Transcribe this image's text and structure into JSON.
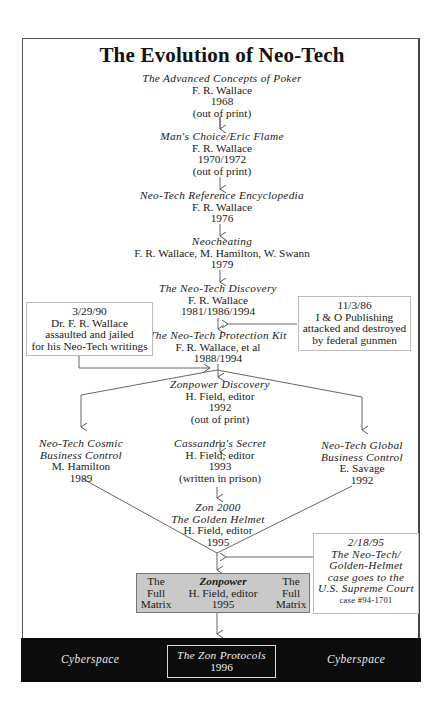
{
  "title": "The Evolution of Neo-Tech",
  "nodes": [
    {
      "title": "The Advanced Concepts of Poker",
      "author": "F. R. Wallace",
      "year": "1968",
      "note": "(out of print)"
    },
    {
      "title": "Man's Choice/Eric Flame",
      "author": "F. R. Wallace",
      "year": "1970/1972",
      "note": "(out of print)"
    },
    {
      "title": "Neo-Tech Reference Encyclopedia",
      "author": "F. R. Wallace",
      "year": "1976"
    },
    {
      "title": "Neocheating",
      "author": "F. R. Wallace, M. Hamilton, W. Swann",
      "year": "1979"
    },
    {
      "title": "The Neo-Tech Discovery",
      "author": "F. R. Wallace",
      "year": "1981/1986/1994"
    },
    {
      "title": "The Neo-Tech Protection Kit",
      "author": "F. R. Wallace, et al",
      "year": "1988/1994"
    },
    {
      "title": "Zonpower Discovery",
      "author": "H. Field, editor",
      "year": "1992",
      "note": "(out of print)"
    },
    {
      "title": "Cassandra's Secret",
      "author": "H. Field, editor",
      "year": "1993",
      "note": "(written in prison)"
    },
    {
      "title_line1": "Zon 2000",
      "title_line2": "The Golden Helmet",
      "author": "H. Field, editor",
      "year": "1995"
    }
  ],
  "side_nodes": {
    "left": {
      "title_line1": "Neo-Tech Cosmic",
      "title_line2": "Business Control",
      "author": "M. Hamilton",
      "year": "1989"
    },
    "right": {
      "title_line1": "Neo-Tech Global",
      "title_line2": "Business Control",
      "author": "E. Savage",
      "year": "1992"
    }
  },
  "events": {
    "left": {
      "date": "3/29/90",
      "lines": [
        "Dr. F. R. Wallace",
        "assaulted and jailed",
        "for his Neo-Tech writings"
      ]
    },
    "right": {
      "date": "11/3/86",
      "lines": [
        "I & O Publishing",
        "attacked and destroyed",
        "by federal gunmen"
      ]
    },
    "court": {
      "date": "2/18/95",
      "lines": [
        "The Neo-Tech/",
        "Golden-Helmet",
        "case goes to the",
        "U.S. Supreme Court"
      ],
      "case": "case #94-1701"
    }
  },
  "zonpower": {
    "side_label": [
      "The",
      "Full",
      "Matrix"
    ],
    "title": "Zonpower",
    "author": "H. Field, editor",
    "year": "1995"
  },
  "cyberspace": {
    "left_label": "Cyberspace",
    "right_label": "Cyberspace",
    "center_title": "The Zon Protocols",
    "center_year": "1996"
  },
  "colors": {
    "band": "#0c0c0c",
    "gray_box": "#c9c9c9",
    "line": "#555555"
  }
}
